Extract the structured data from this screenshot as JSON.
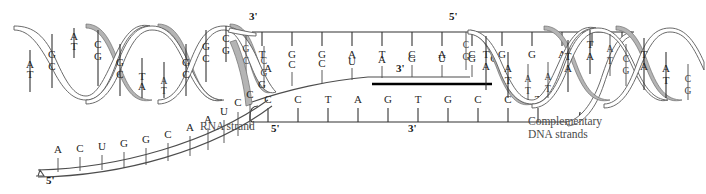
{
  "figure": {
    "width": 706,
    "height": 194,
    "background": "#ffffff"
  },
  "colors": {
    "ink": "#262626",
    "ribbon_gray": "#b4b4b4",
    "ribbon_outline": "#6e6e6e",
    "backbone": "#4d4d4d",
    "caption": "#4a4a4a",
    "hybrid_bar": "#000000"
  },
  "labels": {
    "rna_strand": "RNA strand",
    "complementary_dna": "Complementary\nDNA strands",
    "complementary_dna_line1": "Complementary",
    "complementary_dna_line2": "DNA strands",
    "rna_five_prime": "5'",
    "rna_three_prime": "3'",
    "template_three_prime": "3'",
    "template_five_prime": "5'",
    "coding_five_prime": "5'",
    "coding_three_prime": "3'"
  },
  "bubble": {
    "template_strand": {
      "name": "template-dna-strand",
      "left_end": "3'",
      "right_end": "5'",
      "bases": [
        "T",
        "G",
        "G",
        "A",
        "T",
        "C",
        "A",
        "C",
        "G",
        "G",
        "A"
      ]
    },
    "rna_transcript": {
      "name": "rna-transcript-in-bubble",
      "right_end": "3'",
      "bases": [
        "A",
        "C",
        "C",
        "U",
        "A",
        "G",
        "U",
        "G",
        "C"
      ]
    },
    "coding_strand": {
      "name": "coding-dna-strand",
      "left_end": "5'",
      "right_end": "3'",
      "bases": [
        "C",
        "C",
        "T",
        "A",
        "G",
        "T",
        "G",
        "C",
        "C",
        "T"
      ]
    }
  },
  "rna_tail": {
    "name": "rna-strand-free-tail",
    "five_prime": "5'",
    "bases": [
      "A",
      "C",
      "U",
      "G",
      "G",
      "C",
      "A",
      "A",
      "U",
      "C",
      "C",
      "G"
    ]
  },
  "helix_left": {
    "name": "left-double-helix",
    "base_pairs": [
      {
        "top": "T",
        "bottom": "A"
      },
      {
        "top": "G",
        "bottom": "C"
      },
      {
        "top": "A",
        "bottom": "T"
      },
      {
        "top": "C",
        "bottom": "G"
      },
      {
        "top": "G",
        "bottom": "C"
      },
      {
        "top": "T",
        "bottom": "A"
      },
      {
        "top": "A",
        "bottom": "T"
      },
      {
        "top": "G",
        "bottom": "C"
      },
      {
        "top": "G",
        "bottom": "C"
      },
      {
        "top": "C",
        "bottom": "G"
      },
      {
        "top": "G",
        "bottom": "C"
      },
      {
        "top": "C",
        "bottom": "G"
      }
    ]
  },
  "helix_right": {
    "name": "right-double-helix",
    "base_pairs": [
      {
        "top": "C",
        "bottom": "G"
      },
      {
        "top": "T",
        "bottom": "A"
      },
      {
        "top": "A",
        "bottom": "T"
      },
      {
        "top": "A",
        "bottom": "T"
      },
      {
        "top": "A",
        "bottom": "T"
      },
      {
        "top": "T",
        "bottom": "A"
      },
      {
        "top": "T",
        "bottom": "A"
      },
      {
        "top": "A",
        "bottom": "T"
      },
      {
        "top": "C",
        "bottom": "G"
      },
      {
        "top": "T",
        "bottom": "A"
      },
      {
        "top": "A",
        "bottom": "T"
      },
      {
        "top": "C",
        "bottom": "G"
      }
    ]
  }
}
